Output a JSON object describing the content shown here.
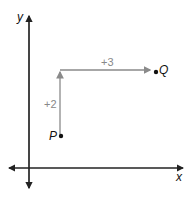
{
  "diagram": {
    "axes": {
      "x_label": "x",
      "y_label": "y"
    },
    "points": [
      {
        "name": "P",
        "label": "P"
      },
      {
        "name": "Q",
        "label": "Q"
      }
    ],
    "steps": {
      "vertical": "+2",
      "horizontal": "+3"
    },
    "colors": {
      "axis": "#222222",
      "step_arrow": "#8a8a8a",
      "point": "#111111"
    }
  }
}
